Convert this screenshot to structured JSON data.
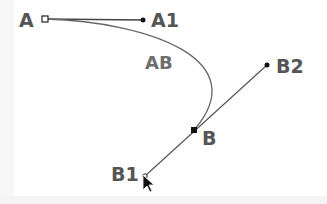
{
  "diagram": {
    "type": "bezier-curve-editing",
    "colors": {
      "handle_line": "#555555",
      "curve": "#666666",
      "label": "#555555",
      "point": "#111111"
    },
    "points": {
      "A": {
        "label": "A",
        "x": 45,
        "y": 19,
        "kind": "anchor-open"
      },
      "A1": {
        "label": "A1",
        "x": 143,
        "y": 20,
        "kind": "handle"
      },
      "B": {
        "label": "B",
        "x": 194,
        "y": 130,
        "kind": "anchor-filled"
      },
      "B1": {
        "label": "B1",
        "x": 145,
        "y": 176,
        "kind": "handle"
      },
      "B2": {
        "label": "B2",
        "x": 267,
        "y": 65,
        "kind": "handle"
      }
    },
    "curve_label": "AB",
    "cursor": "mouse-pointer"
  }
}
